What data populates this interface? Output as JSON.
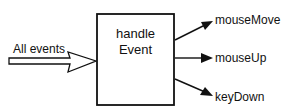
{
  "diagram": {
    "input_label": "All events",
    "handler": {
      "line1": "handle",
      "line2": "Event"
    },
    "outputs": [
      {
        "label": "mouseMove"
      },
      {
        "label": "mouseUp"
      },
      {
        "label": "keyDown"
      }
    ],
    "colors": {
      "stroke": "#111111",
      "background": "#ffffff"
    }
  }
}
